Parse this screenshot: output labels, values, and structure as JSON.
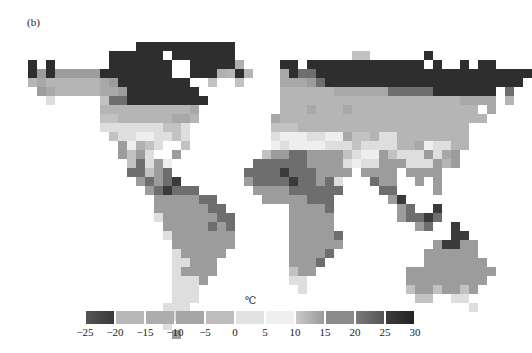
{
  "panel_label": "(b)",
  "unit": "℃",
  "colorbar": {
    "ticks": [
      "−25",
      "−20",
      "−15",
      "−10",
      "−5",
      "0",
      "5",
      "10",
      "15",
      "20",
      "25",
      "30"
    ],
    "segments": [
      {
        "range": "-25 to -20",
        "color": "#555555",
        "gradient_to": "#3a3a3a"
      },
      {
        "range": "-20 to -15",
        "color": "#b8b8b8"
      },
      {
        "range": "-15 to -10",
        "color": "#adadad"
      },
      {
        "range": "-10 to -5",
        "color": "#a5a5a5"
      },
      {
        "range": "-5 to 0",
        "color": "#bdbdbd"
      },
      {
        "range": "0 to 5",
        "color": "#e2e2e2"
      },
      {
        "range": "5 to 10",
        "color": "#efefef"
      },
      {
        "range": "10 to 15",
        "color": "#c9c9c9",
        "gradient_to": "#9a9a9a"
      },
      {
        "range": "15 to 20",
        "color": "#8a8a8a"
      },
      {
        "range": "20 to 25",
        "color": "#7a7a7a",
        "gradient_to": "#555555"
      },
      {
        "range": "25 to 30",
        "color": "#3c3c3c",
        "gradient_to": "#222222"
      }
    ]
  },
  "chart_data": {
    "type": "heatmap",
    "title": "(b)",
    "colorbar_label": "℃",
    "colorbar_ticks": [
      -25,
      -20,
      -15,
      -10,
      -5,
      0,
      5,
      10,
      15,
      20,
      25,
      30
    ],
    "classes": [
      {
        "key": "A",
        "range": [
          -25,
          -20
        ],
        "color": "#2e2e2e"
      },
      {
        "key": "B",
        "range": [
          -20,
          -15
        ],
        "color": "#b5b5b5"
      },
      {
        "key": "C",
        "range": [
          -15,
          -10
        ],
        "color": "#a8a8a8"
      },
      {
        "key": "D",
        "range": [
          -10,
          -5
        ],
        "color": "#9c9c9c"
      },
      {
        "key": "E",
        "range": [
          -5,
          0
        ],
        "color": "#c2c2c2"
      },
      {
        "key": "F",
        "range": [
          0,
          5
        ],
        "color": "#dedede"
      },
      {
        "key": "G",
        "range": [
          5,
          10
        ],
        "color": "#eeeeee"
      },
      {
        "key": "H",
        "range": [
          10,
          15
        ],
        "color": "#b0b0b0"
      },
      {
        "key": "I",
        "range": [
          15,
          20
        ],
        "color": "#8c8c8c"
      },
      {
        "key": "J",
        "range": [
          20,
          25
        ],
        "color": "#6e6e6e"
      },
      {
        "key": "K",
        "range": [
          25,
          30
        ],
        "color": "#3a3a3a"
      }
    ],
    "grid": {
      "origin_x": 28,
      "origin_y": 42,
      "cell": 9,
      "rows": [
        "............AAAAAAAAAAA..................................",
        ".........AAAAAA.AAAAAAA.............EE......A...........",
        "A.A......AAAAAAA..AAAAAH....AA.AAAAAAAAAAAAA.A..A.AA....",
        "ADADDDDDAAAAAAAA..AAAHBAB...CAJJAAAAAAAAAAAAAAAAAAAAAAAA",
        "BCBBBBBBCDAAAAAAAA..E..E....CCCDJAAAAAAAAAAAAAAAAAAAAAA",
        ".DCBBBBBCCDAAAAAAAA.........BBBBBBCCCCCCJJJJJAAAAAAA.J.",
        "..F.....EJJAAAAAAAAA........BBBBBBBBBBBBBBBBBBBBCCCC.B..",
        "........BBBBBBBBBBC.........BBBCBBBCBBBBBBBBBBBBBB.C...",
        "........EEBBBBBBCCB........CBBBBBBBBBBBBBBBBBBBBBBB....",
        "........FFFFFFFEEF.........EEEBBBBBBBBBBBBBBBBBBB.....",
        ".........EFFGGFFEF.........FGGGFFGGCEEBFFBBBBBBBB.....",
        "..........DGHEF..E.........GFGGGGFFFEFFFFBBCGFFBB.....",
        "..........DEDF..D.........EDDJJDDDDEFGGDEFFFDFCD.....",
        "...........EJFDG.........JJJJJJDDDDFGFFDDDFFFDBD......",
        "...........JJEDJ........JJJJKJJJDDDD.DDDD.DDDD.......",
        "............DJDJK.......DJJJJKJJDJF...JDD..D.D.......",
        ".............DJKJJJ......DDDDJJJJJJ....JJ....D.......",
        "..............DDDDDJJ.....DDDDDJJJ......DK..........",
        "..............DDDDDDJJ.......DDDDJ.......DJ..K......",
        "..............FDDDDDDJJ......DDDDD.......DJJKJ......",
        "...............DDDDDJDJ......DDDDD.........DJ..K....",
        "...............FDDDDDDD......DDDDDJ............KK...",
        "................DDDDDDD......DDDDDD..........DKKDD..",
        "................FDDDDD.......DDDDJ..........DDDDDD..",
        "................FFDDD........DDDJ...........DDDDDDD.",
        "................FDDDD........EDD..........DDDDDDDDDD",
        "................FFFD.........FF...........DDDDDDDDD.",
        "................FFF...........F...........EDDEDDED.",
        "................FFF........................EE..FF..",
        "...............FFF...............................F.",
        "...............DF.................................",
        "...............F..................................",
        "................D................................."
      ]
    },
    "regions": [
      "North America",
      "Greenland",
      "South America",
      "Europe",
      "Asia",
      "Africa",
      "Australia"
    ]
  }
}
